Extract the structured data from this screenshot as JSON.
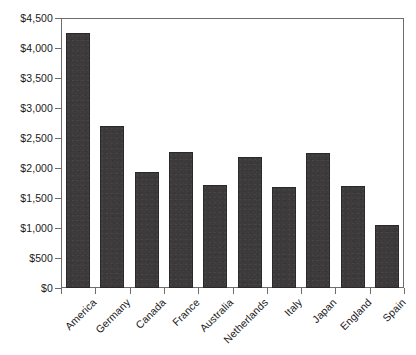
{
  "chart_data": {
    "type": "bar",
    "title": "",
    "subtitle": "",
    "xlabel": "",
    "ylabel": "",
    "categories": [
      "America",
      "Germany",
      "Canada",
      "France",
      "Australia",
      "Netherlands",
      "Italy",
      "Japan",
      "England",
      "Spain"
    ],
    "values": [
      4250,
      2700,
      1930,
      2270,
      1720,
      2180,
      1690,
      2250,
      1700,
      1050
    ],
    "series": [
      {
        "name": "",
        "values": [
          4250,
          2700,
          1930,
          2270,
          1720,
          2180,
          1690,
          2250,
          1700,
          1050
        ]
      }
    ],
    "ylim": [
      0,
      4500
    ],
    "ytick_values": [
      0,
      500,
      1000,
      1500,
      2000,
      2500,
      3000,
      3500,
      4000,
      4500
    ],
    "ytick_labels": [
      "$0",
      "$500",
      "$1,000",
      "$1,500",
      "$2,000",
      "$2,500",
      "$3,000",
      "$3,500",
      "$4,000",
      "$4,500"
    ],
    "grid": false,
    "legend": "none",
    "bar_color": "#3c3a3a",
    "axis_color": "#6d6d6d",
    "background_color": "#ffffff",
    "xtick_label_rotation": -45
  }
}
